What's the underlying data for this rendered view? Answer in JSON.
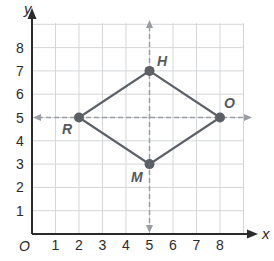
{
  "diagram": {
    "type": "coordinate-plane",
    "axes": {
      "x_label": "x",
      "y_label": "y",
      "origin_label": "O"
    },
    "x_ticks": [
      "1",
      "2",
      "3",
      "4",
      "5",
      "6",
      "7",
      "8"
    ],
    "y_ticks": [
      "1",
      "2",
      "3",
      "4",
      "5",
      "6",
      "7",
      "8"
    ],
    "points": [
      {
        "label": "H",
        "x": 5,
        "y": 7
      },
      {
        "label": "O",
        "x": 8,
        "y": 5
      },
      {
        "label": "M",
        "x": 5,
        "y": 3
      },
      {
        "label": "R",
        "x": 2,
        "y": 5
      }
    ],
    "polygon": [
      "H",
      "O",
      "M",
      "R"
    ],
    "dashed_lines": [
      {
        "orientation": "vertical",
        "at_x": 5
      },
      {
        "orientation": "horizontal",
        "at_y": 5
      }
    ],
    "colors": {
      "grid": "#d4d6d8",
      "axis": "#2b2b2b",
      "shape": "#5b6066",
      "dashed": "#9a9ea3"
    }
  }
}
